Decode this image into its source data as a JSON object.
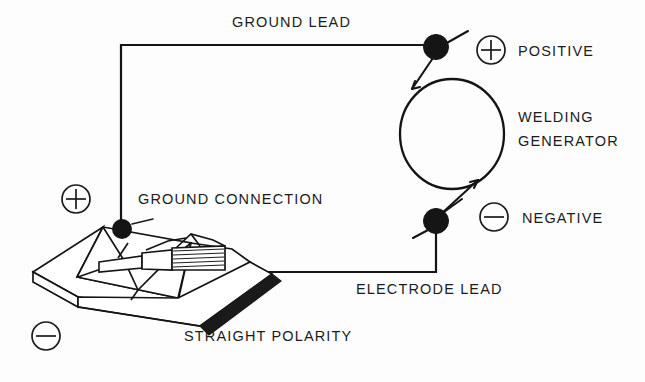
{
  "diagram": {
    "title_caption": "STRAIGHT POLARITY",
    "labels": {
      "ground_lead": "GROUND LEAD",
      "positive": "POSITIVE",
      "welding_generator_line1": "WELDING",
      "welding_generator_line2": "GENERATOR",
      "negative": "NEGATIVE",
      "ground_connection": "GROUND CONNECTION",
      "electrode_lead": "ELECTRODE LEAD",
      "straight_polarity": "STRAIGHT POLARITY"
    },
    "symbols": {
      "workpiece_polarity": "+",
      "base_polarity": "-",
      "positive_terminal_sign": "+",
      "negative_terminal_sign": "-"
    },
    "colors": {
      "ink": "#141414",
      "background": "#fdfdfd",
      "shaded_edge": "#1a1a1a"
    },
    "components": [
      "welding-generator",
      "positive-terminal",
      "negative-terminal",
      "ground-lead-wire",
      "electrode-lead-wire",
      "electrode-holder",
      "electrode-rod",
      "workpiece-plate",
      "ground-connection-point"
    ]
  }
}
